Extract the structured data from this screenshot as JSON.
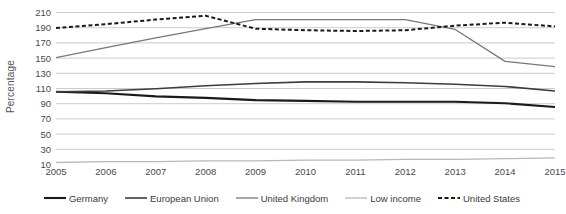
{
  "chart_data": {
    "type": "line",
    "title": "",
    "xlabel": "",
    "ylabel": "Percentage",
    "x": [
      2005,
      2006,
      2007,
      2008,
      2009,
      2010,
      2011,
      2012,
      2013,
      2014,
      2015
    ],
    "categories": [
      "2005",
      "2006",
      "2007",
      "2008",
      "2009",
      "2010",
      "2011",
      "2012",
      "2013",
      "2014",
      "2015"
    ],
    "ylim": [
      10,
      210
    ],
    "yticks": [
      210,
      190,
      170,
      150,
      130,
      110,
      90,
      70,
      50,
      30,
      10
    ],
    "grid": true,
    "legend_position": "bottom",
    "series": [
      {
        "name": "Germany",
        "color": "#1a1a1a",
        "width": 2.1,
        "dash": "none",
        "values": [
          105,
          103,
          99,
          97,
          94,
          93,
          92,
          92,
          92,
          90,
          85
        ]
      },
      {
        "name": "European Union",
        "color": "#3d3d3d",
        "width": 1.6,
        "dash": "none",
        "values": [
          105,
          106,
          109,
          113,
          116,
          118,
          118,
          117,
          115,
          112,
          106
        ]
      },
      {
        "name": "United Kingdom",
        "color": "#777777",
        "width": 1.3,
        "dash": "none",
        "values": [
          150,
          163,
          176,
          188,
          200,
          200,
          200,
          200,
          187,
          145,
          138
        ]
      },
      {
        "name": "Low income",
        "color": "#b8b8b8",
        "width": 1.3,
        "dash": "none",
        "values": [
          12,
          13,
          13,
          14,
          14,
          15,
          15,
          16,
          16,
          17,
          18
        ]
      },
      {
        "name": "United States",
        "color": "#1a1a1a",
        "width": 2.0,
        "dash": "4,2.5",
        "values": [
          189,
          194,
          200,
          205,
          188,
          186,
          185,
          186,
          192,
          196,
          191
        ]
      }
    ]
  },
  "legend": {
    "items": [
      {
        "label": "Germany"
      },
      {
        "label": "European Union"
      },
      {
        "label": "United Kingdom"
      },
      {
        "label": "Low income"
      },
      {
        "label": "United States"
      }
    ]
  }
}
